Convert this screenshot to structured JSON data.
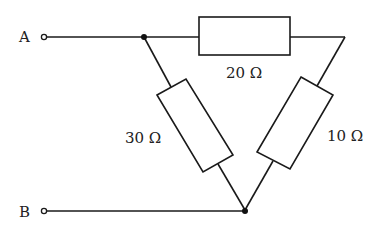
{
  "diagram": {
    "type": "circuit",
    "terminals": [
      {
        "id": "A",
        "label": "A"
      },
      {
        "id": "B",
        "label": "B"
      }
    ],
    "resistors": [
      {
        "id": "R_top",
        "label": "20 Ω",
        "value_ohms": 20,
        "between": [
          "node_top_left",
          "node_top_right"
        ]
      },
      {
        "id": "R_left",
        "label": "30 Ω",
        "value_ohms": 30,
        "between": [
          "node_top_left",
          "node_bottom"
        ]
      },
      {
        "id": "R_right",
        "label": "10 Ω",
        "value_ohms": 10,
        "between": [
          "node_top_right",
          "node_bottom"
        ]
      }
    ],
    "colors": {
      "line": "#1a1a1a",
      "background": "#ffffff",
      "text": "#222222"
    }
  }
}
